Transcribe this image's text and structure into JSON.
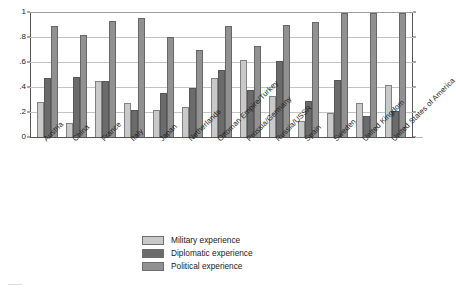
{
  "chart_data": {
    "type": "bar",
    "title": "",
    "subtitle": "",
    "xlabel": "",
    "ylabel": "",
    "ylim": [
      0,
      1
    ],
    "yticks": [
      "0",
      ".2",
      ".4",
      ".6",
      ".8",
      "1"
    ],
    "ytick_values": [
      0,
      0.2,
      0.4,
      0.6,
      0.8,
      1
    ],
    "grid": true,
    "legend_position": "bottom-center",
    "categories": [
      "Austria",
      "China",
      "France",
      "Italy",
      "Japan",
      "Netherlands",
      "Ottoman Empire/Turkey",
      "Prussia/Germany",
      "Russia/USSR",
      "Spain",
      "Sweden",
      "United Kingdom",
      "United States of America"
    ],
    "series": [
      {
        "name": "Military experience",
        "color": "#c9c9c9",
        "values": [
          0.28,
          0.11,
          0.45,
          0.27,
          0.22,
          0.24,
          0.47,
          0.62,
          0.33,
          0.13,
          0.19,
          0.27,
          0.42
        ]
      },
      {
        "name": "Diplomatic experience",
        "color": "#6b6b6b",
        "values": [
          0.47,
          0.48,
          0.45,
          0.22,
          0.35,
          0.39,
          0.54,
          0.38,
          0.61,
          0.29,
          0.46,
          0.17,
          0.21
        ]
      },
      {
        "name": "Political experience",
        "color": "#919191",
        "values": [
          0.89,
          0.82,
          0.93,
          0.95,
          0.8,
          0.7,
          0.89,
          0.73,
          0.9,
          0.92,
          0.99,
          0.99,
          0.99
        ]
      }
    ]
  },
  "legend": {
    "items": [
      {
        "label": "Military experience"
      },
      {
        "label": "Diplomatic experience"
      },
      {
        "label": "Political experience"
      }
    ]
  }
}
